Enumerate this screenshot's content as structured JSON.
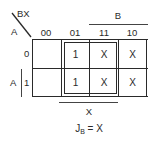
{
  "kmap": {
    "title": "Karnaugh map for J_B",
    "corner": {
      "col_vars": "BX",
      "row_var": "A"
    },
    "column_labels": [
      "00",
      "01",
      "11",
      "10"
    ],
    "row_labels": [
      "0",
      "1"
    ],
    "cells": [
      [
        "",
        "1",
        "X",
        "X"
      ],
      [
        "",
        "1",
        "X",
        "X"
      ]
    ],
    "brackets": {
      "top": "B",
      "left": "A",
      "bottom": "X"
    },
    "group": {
      "columns": [
        "01",
        "11"
      ],
      "rows": [
        "0",
        "1"
      ]
    },
    "equation": {
      "lhs": "J",
      "lhs_sub": "B",
      "rhs": "= X"
    }
  }
}
